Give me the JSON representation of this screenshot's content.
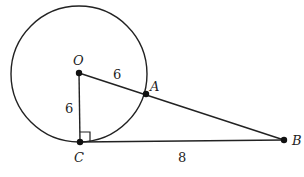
{
  "diagram": {
    "type": "geometry",
    "circle": {
      "center": "O",
      "radius": 6
    },
    "points": {
      "O": {
        "label": "O",
        "x": 79,
        "y": 73
      },
      "A": {
        "label": "A",
        "x": 146,
        "y": 94
      },
      "B": {
        "label": "B",
        "x": 284,
        "y": 140
      },
      "C": {
        "label": "C",
        "x": 80,
        "y": 142
      }
    },
    "segments": [
      {
        "from": "O",
        "to": "A",
        "label": "6"
      },
      {
        "from": "A",
        "to": "B",
        "label": ""
      },
      {
        "from": "O",
        "to": "C",
        "label": "6"
      },
      {
        "from": "C",
        "to": "B",
        "label": "8"
      }
    ],
    "right_angle_at": "C",
    "colors": {
      "stroke": "#222222",
      "background": "#ffffff"
    }
  }
}
